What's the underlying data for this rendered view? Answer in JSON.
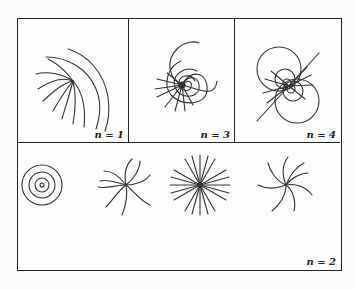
{
  "figure": {
    "panels": [
      {
        "id": "n1",
        "label": "n = 1",
        "description": "curved field lines fanning from a point"
      },
      {
        "id": "n3",
        "label": "n = 3",
        "description": "spiral loops around a singular point"
      },
      {
        "id": "n4",
        "label": "n = 4",
        "description": "dipole-like loops along a diagonal line"
      },
      {
        "id": "n2",
        "label": "n = 2",
        "description": "concentric circles, spiral, radial star, spiral"
      }
    ],
    "colors": {
      "line": "#333333",
      "frame": "#222222",
      "background": "#fdfdfc"
    }
  }
}
